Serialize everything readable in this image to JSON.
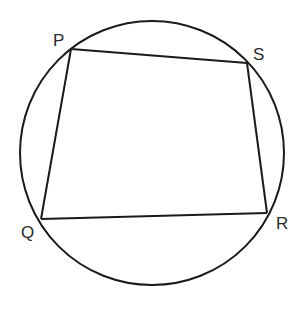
{
  "diagram": {
    "circle": {
      "cx": 152,
      "cy": 153,
      "r": 132
    },
    "stroke_color": "#1a1a1a",
    "label_color": "#2a2a2a",
    "vertices": {
      "P": {
        "x": 71,
        "y": 49
      },
      "S": {
        "x": 247,
        "y": 63
      },
      "R": {
        "x": 267,
        "y": 213
      },
      "Q": {
        "x": 41,
        "y": 219
      }
    },
    "labels": [
      {
        "id": "P",
        "text": "P",
        "x": 53,
        "y": 46
      },
      {
        "id": "S",
        "text": "S",
        "x": 253,
        "y": 60
      },
      {
        "id": "Q",
        "text": "Q",
        "x": 21,
        "y": 238
      },
      {
        "id": "R",
        "text": "R",
        "x": 276,
        "y": 229
      }
    ],
    "edges": [
      [
        "P",
        "S"
      ],
      [
        "S",
        "R"
      ],
      [
        "R",
        "Q"
      ],
      [
        "Q",
        "P"
      ]
    ]
  }
}
